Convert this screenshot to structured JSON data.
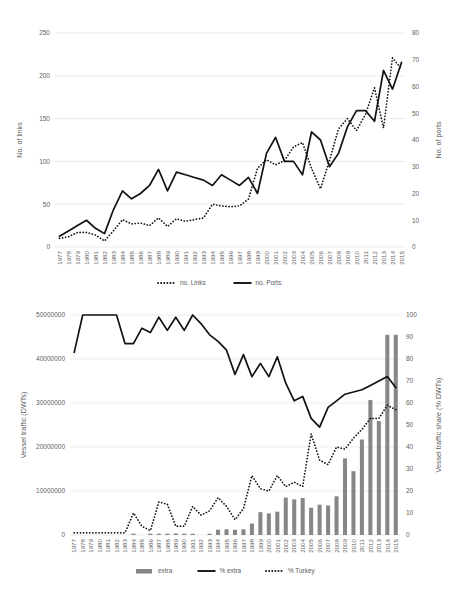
{
  "figure": {
    "background": "#ffffff",
    "line_color": "#121212",
    "bar_color": "#878787",
    "grid_color": "#e4e4e4"
  },
  "chart_data": [
    {
      "id": "top",
      "type": "line",
      "title": "",
      "xlabel": "",
      "ylabel": "No. of links",
      "y2label": "No. of ports",
      "ylim": [
        0,
        250
      ],
      "y2lim": [
        0,
        80
      ],
      "yticks": [
        0,
        50,
        100,
        150,
        200,
        250
      ],
      "y2ticks": [
        0,
        10,
        20,
        30,
        40,
        50,
        60,
        70,
        80
      ],
      "grid": true,
      "legend_position": "bottom",
      "categories": [
        "1977",
        "1978",
        "1979",
        "1980",
        "1981",
        "1982",
        "1983",
        "1984",
        "1985",
        "1986",
        "1987",
        "1988",
        "1989",
        "1990",
        "1991",
        "1992",
        "1993",
        "1994",
        "1995",
        "1996",
        "1997",
        "1998",
        "1999",
        "2000",
        "2001",
        "2002",
        "2003",
        "2004",
        "2005",
        "2006",
        "2007",
        "2008",
        "2009",
        "2010",
        "2011",
        "2012",
        "2013",
        "2014",
        "2015"
      ],
      "series": [
        {
          "name": "no. Links",
          "style": "dotted",
          "axis": "left",
          "values": [
            10,
            12,
            17,
            17,
            14,
            7,
            19,
            32,
            27,
            28,
            25,
            34,
            24,
            33,
            30,
            32,
            34,
            50,
            48,
            47,
            48,
            56,
            92,
            102,
            96,
            101,
            117,
            122,
            92,
            68,
            101,
            138,
            150,
            136,
            155,
            186,
            139,
            221,
            208
          ]
        },
        {
          "name": "no. Ports",
          "style": "solid",
          "axis": "right",
          "values": [
            4,
            6,
            8,
            10,
            7,
            5,
            14,
            21,
            18,
            20,
            23,
            29,
            21,
            28,
            27,
            26,
            25,
            23,
            27,
            25,
            23,
            26,
            20,
            35,
            41,
            32,
            32,
            27,
            43,
            40,
            30,
            35,
            45,
            51,
            51,
            47,
            66,
            59,
            69
          ]
        }
      ],
      "legend": [
        {
          "label": "no. Links",
          "style": "dotted"
        },
        {
          "label": "no. Ports",
          "style": "solid"
        }
      ]
    },
    {
      "id": "bottom",
      "type": "bar+line",
      "title": "",
      "xlabel": "",
      "ylabel": "Vessel traffic (DWTs)",
      "y2label": "Vessel traffic share (% DWTs)",
      "ylim": [
        0,
        50000000
      ],
      "y2lim": [
        0,
        100
      ],
      "yticks": [
        0,
        10000000,
        20000000,
        30000000,
        40000000,
        50000000
      ],
      "ytick_labels": [
        "0",
        "10000000",
        "20000000",
        "30000000",
        "40000000",
        "50000000"
      ],
      "y2ticks": [
        0,
        10,
        20,
        30,
        40,
        50,
        60,
        70,
        80,
        90,
        100
      ],
      "grid": true,
      "legend_position": "bottom",
      "categories": [
        "1977",
        "1978",
        "1979",
        "1980",
        "1981",
        "1982",
        "1983",
        "1984",
        "1985",
        "1986",
        "1987",
        "1988",
        "1989",
        "1990",
        "1991",
        "1992",
        "1993",
        "1994",
        "1995",
        "1996",
        "1997",
        "1998",
        "1999",
        "2000",
        "2001",
        "2002",
        "2003",
        "2004",
        "2005",
        "2006",
        "2007",
        "2008",
        "2009",
        "2010",
        "2011",
        "2012",
        "2013",
        "2014",
        "2015"
      ],
      "series": [
        {
          "name": "extra",
          "style": "bar",
          "axis": "left",
          "values": [
            0,
            0,
            0,
            0,
            0,
            0,
            0,
            300000,
            0,
            300000,
            300000,
            300000,
            350000,
            300000,
            300000,
            0,
            300000,
            1200000,
            1300000,
            1200000,
            1300000,
            2600000,
            5200000,
            4900000,
            5300000,
            8500000,
            8100000,
            8400000,
            6200000,
            6900000,
            6700000,
            8800000,
            17400000,
            14500000,
            21700000,
            30700000,
            25900000,
            45500000,
            45500000
          ]
        },
        {
          "name": "% extra",
          "style": "solid",
          "axis": "right",
          "values": [
            83,
            100,
            100,
            100,
            100,
            100,
            87,
            87,
            94,
            92,
            99,
            93,
            99,
            93,
            100,
            96,
            91,
            88,
            84,
            73,
            82,
            72,
            78,
            72,
            81,
            69,
            61,
            63,
            53,
            49,
            58,
            61,
            64,
            65,
            66,
            68,
            70,
            72,
            67
          ]
        },
        {
          "name": "% Turkey",
          "style": "dotted",
          "axis": "right",
          "values": [
            1,
            1,
            1,
            1,
            1,
            1,
            1,
            10,
            4,
            2,
            15,
            14,
            4,
            4,
            13,
            9,
            11,
            17,
            13,
            7,
            12,
            27,
            21,
            20,
            27,
            22,
            24,
            22,
            46,
            34,
            32,
            40,
            39,
            44,
            48,
            53,
            53,
            59,
            57
          ]
        }
      ],
      "legend": [
        {
          "label": "extra",
          "style": "bar"
        },
        {
          "label": "% extra",
          "style": "solid"
        },
        {
          "label": "% Turkey",
          "style": "dotted"
        }
      ]
    }
  ]
}
